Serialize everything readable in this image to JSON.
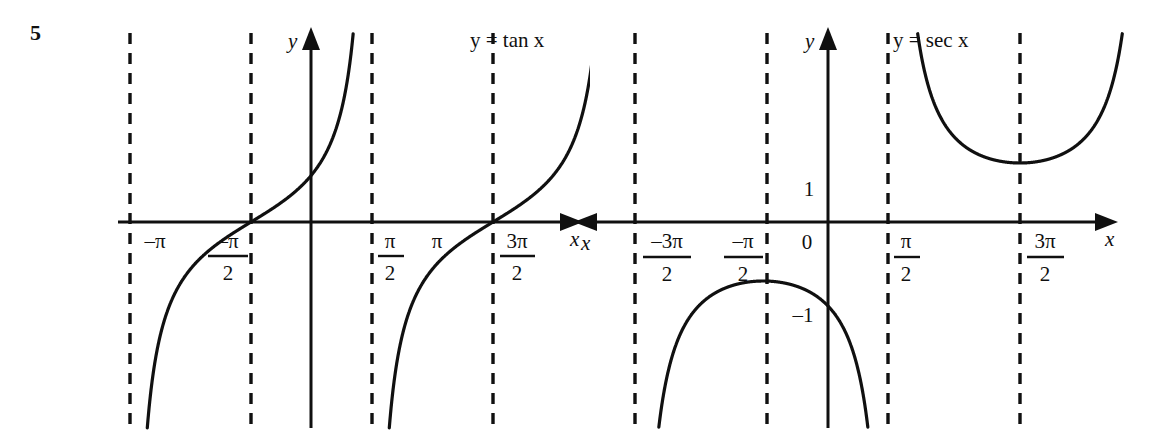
{
  "figure": {
    "number": "5",
    "background_color": "#ffffff",
    "ink_color": "#101010"
  },
  "chart_data": [
    {
      "type": "line",
      "title": "y = tan x",
      "panel": "left",
      "xlabel": "x",
      "ylabel": "y",
      "function": "tan",
      "xlim": [
        -4.71238898038469,
        4.71238898038469
      ],
      "ylim": [
        -4.2,
        4.2
      ],
      "grid": false,
      "legend": "none",
      "origin_label": "",
      "x_tick_labels": [
        "-π",
        "-π/2",
        "π/2",
        "π",
        "3π/2"
      ],
      "x_tick_values": [
        -3.14159265,
        -1.57079633,
        1.57079633,
        3.14159265,
        4.71238898
      ],
      "y_tick_labels": [],
      "y_tick_values": [],
      "asymptotes": [
        -4.71238898,
        -1.57079633,
        1.57079633,
        4.71238898
      ],
      "asymptote_style": "dashed",
      "axis_arrows": [
        "x-right",
        "y-up"
      ],
      "branches": [
        {
          "domain": [
            -4.71238898,
            -1.57079633
          ],
          "zero_at": -3.14159265
        },
        {
          "domain": [
            -1.57079633,
            1.57079633
          ],
          "zero_at": 0.0
        },
        {
          "domain": [
            1.57079633,
            4.71238898
          ],
          "zero_at": 3.14159265
        }
      ]
    },
    {
      "type": "line",
      "title": "y = sec x",
      "panel": "right",
      "xlabel": "x",
      "ylabel": "y",
      "function": "sec",
      "xlim": [
        -5.4,
        5.4
      ],
      "ylim": [
        -4.2,
        4.2
      ],
      "grid": false,
      "legend": "none",
      "origin_label": "0",
      "x_tick_labels": [
        "-3π/2",
        "-π/2",
        "0",
        "π/2",
        "3π/2"
      ],
      "x_tick_values": [
        -4.71238898,
        -1.57079633,
        0.0,
        1.57079633,
        4.71238898
      ],
      "y_tick_labels": [
        "1",
        "-1"
      ],
      "y_tick_values": [
        1,
        -1
      ],
      "asymptotes": [
        -4.71238898,
        -1.57079633,
        1.57079633,
        4.71238898
      ],
      "asymptote_style": "dashed",
      "axis_arrows": [
        "x-right",
        "x-left",
        "y-up"
      ],
      "branches": [
        {
          "domain": [
            -4.71238898,
            -1.57079633
          ],
          "vertex": [
            -3.14159265,
            -1
          ]
        },
        {
          "domain": [
            -1.57079633,
            1.57079633
          ],
          "vertex": [
            0.0,
            1
          ]
        },
        {
          "domain": [
            1.57079633,
            4.71238898
          ],
          "vertex": [
            3.14159265,
            -1
          ]
        }
      ]
    }
  ],
  "panels": {
    "tan": {
      "function_label": "y = tan x",
      "y_axis_name": "y",
      "x_axis_name": "x",
      "ticks": [
        {
          "name": "neg-pi",
          "text": "–π",
          "kind": "plain"
        },
        {
          "name": "neg-pi-over-2",
          "num": "–π",
          "den": "2",
          "kind": "fraction"
        },
        {
          "name": "pi-over-2",
          "num": "π",
          "den": "2",
          "kind": "fraction"
        },
        {
          "name": "pi",
          "text": "π",
          "kind": "plain"
        },
        {
          "name": "three-pi-over-2",
          "num": "3π",
          "den": "2",
          "kind": "fraction"
        }
      ]
    },
    "sec": {
      "function_label": "y = sec x",
      "y_axis_name": "y",
      "x_axis_name": "x",
      "x_axis_name_left": "x",
      "origin": "0",
      "y_pos_one": "1",
      "y_neg_one": "–1",
      "ticks": [
        {
          "name": "neg-three-pi-over-2",
          "num": "–3π",
          "den": "2",
          "kind": "fraction"
        },
        {
          "name": "neg-pi-over-2",
          "num": "–π",
          "den": "2",
          "kind": "fraction"
        },
        {
          "name": "pi-over-2",
          "num": "π",
          "den": "2",
          "kind": "fraction"
        },
        {
          "name": "three-pi-over-2",
          "num": "3π",
          "den": "2",
          "kind": "fraction"
        }
      ]
    }
  }
}
